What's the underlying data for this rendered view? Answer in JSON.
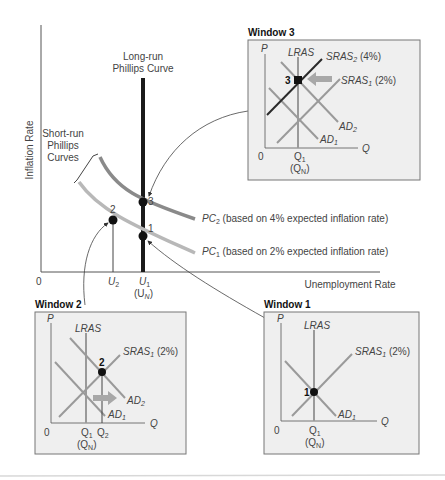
{
  "main_chart": {
    "y_axis_label": "Inflation Rate",
    "x_axis_label": "Unemployment Rate",
    "origin_label": "0",
    "lrpc_label_line1": "Long-run",
    "lrpc_label_line2": "Phillips Curve",
    "srpc_label_line1": "Short-run",
    "srpc_label_line2": "Phillips",
    "srpc_label_line3": "Curves",
    "pc2": {
      "name": "PC",
      "sub": "2",
      "desc": " (based on 4% expected inflation rate)"
    },
    "pc1": {
      "name": "PC",
      "sub": "1",
      "desc": " (based on 2% expected inflation rate)"
    },
    "points": {
      "p1": "1",
      "p2": "2",
      "p3": "3"
    },
    "x_ticks": {
      "u2": "U",
      "u2_sub": "2",
      "u1": "U",
      "u1_sub": "1",
      "un": "(U",
      "un_sub": "N",
      "un_close": ")"
    }
  },
  "window3": {
    "title": "Window 3",
    "p_label": "P",
    "q_label": "Q",
    "origin": "0",
    "lras": "LRAS",
    "sras2": "SRAS",
    "sras2_sub": "2",
    "sras2_pct": " (4%)",
    "sras1": "SRAS",
    "sras1_sub": "1",
    "sras1_pct": " (2%)",
    "ad2": "AD",
    "ad2_sub": "2",
    "ad1": "AD",
    "ad1_sub": "1",
    "point": "3",
    "q1": "Q",
    "q1_sub": "1",
    "qn": "(Q",
    "qn_sub": "N",
    "qn_close": ")"
  },
  "window2": {
    "title": "Window 2",
    "p_label": "P",
    "q_label": "Q",
    "origin": "0",
    "lras": "LRAS",
    "sras1": "SRAS",
    "sras1_sub": "1",
    "sras1_pct": " (2%)",
    "ad2": "AD",
    "ad2_sub": "2",
    "ad1": "AD",
    "ad1_sub": "1",
    "point": "2",
    "q1": "Q",
    "q1_sub": "1",
    "q2": "Q",
    "q2_sub": "2",
    "qn": "(Q",
    "qn_sub": "N",
    "qn_close": ")"
  },
  "window1": {
    "title": "Window 1",
    "p_label": "P",
    "q_label": "Q",
    "origin": "0",
    "lras": "LRAS",
    "sras1": "SRAS",
    "sras1_sub": "1",
    "sras1_pct": " (2%)",
    "ad1": "AD",
    "ad1_sub": "1",
    "point": "1",
    "q1": "Q",
    "q1_sub": "1",
    "qn": "(Q",
    "qn_sub": "N",
    "qn_close": ")"
  },
  "colors": {
    "lrpc": "#1a1a1a",
    "pc2": "#8a8a8a",
    "pc1": "#b8b8b8",
    "window_bg": "#efefef",
    "window_border": "#777777",
    "curve_gray": "#9a9a9a",
    "sras2_dark": "#2a2a2a",
    "shift_arrow": "#a8a8a8"
  }
}
